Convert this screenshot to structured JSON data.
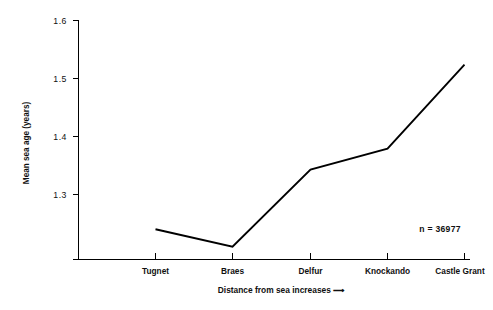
{
  "chart_data": {
    "type": "line",
    "title": "",
    "subtitle": "",
    "xlabel": "Distance from sea increases ⟶",
    "ylabel": "Mean sea age (years)",
    "categories": [
      "Tugnet",
      "Braes",
      "Delfur",
      "Knockando",
      "Castle Grant"
    ],
    "values": [
      1.24,
      1.21,
      1.343,
      1.379,
      1.524
    ],
    "series": [
      {
        "name": "Mean sea age",
        "values": [
          1.24,
          1.21,
          1.343,
          1.379,
          1.524
        ]
      }
    ],
    "ylim": [
      1.17,
      1.6
    ],
    "y_ticks": [
      1.3,
      1.4,
      1.5,
      1.6
    ],
    "y_tick_labels": [
      "1.3",
      "1.4",
      "1.5",
      "1.6"
    ],
    "x_tick_labels": [
      "Tugnet",
      "Braes",
      "Delfur",
      "Knockando",
      "Castle Grant"
    ],
    "grid": false,
    "legend": false,
    "legend_position": "none",
    "line_color": "#000000",
    "background_color": "#ffffff",
    "annotations": [
      {
        "text": "n = 36977",
        "x_category": "Castle Grant",
        "value": 1.232
      }
    ]
  },
  "axes": {
    "y_axis_label": "Mean sea age (years)",
    "x_axis_label": "Distance from sea increases ⟶",
    "y_ticks": [
      {
        "label": "1.6",
        "value": 1.6
      },
      {
        "label": "1.5",
        "value": 1.5
      },
      {
        "label": "1.4",
        "value": 1.4
      },
      {
        "label": "1.3",
        "value": 1.3
      }
    ],
    "x_ticks": [
      {
        "label": "Tugnet"
      },
      {
        "label": "Braes"
      },
      {
        "label": "Delfur"
      },
      {
        "label": "Knockando"
      },
      {
        "label": "Castle Grant"
      }
    ]
  },
  "annotation": {
    "sample_size_label": "n = 36977"
  }
}
